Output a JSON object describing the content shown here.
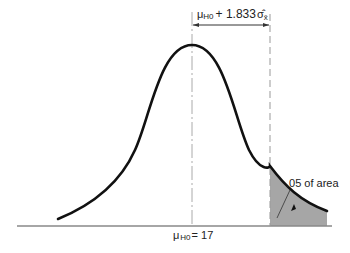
{
  "diagram": {
    "type": "normal-distribution-one-tailed-test",
    "top_bracket": {
      "mu_symbol": "μ",
      "mu_subscript": "H0",
      "expression": "+ 1.833",
      "sigma_symbol": "σ̂",
      "sigma_subscript": "x̄"
    },
    "mean_label": {
      "mu_symbol": "μ",
      "mu_subscript": "H0",
      "equals_value": "= 17"
    },
    "tail_label": ".05 of area",
    "colors": {
      "curve": "#111111",
      "shaded_tail": "#a6a6a6",
      "baseline": "#888888",
      "dashed_lines": "#999999"
    }
  }
}
